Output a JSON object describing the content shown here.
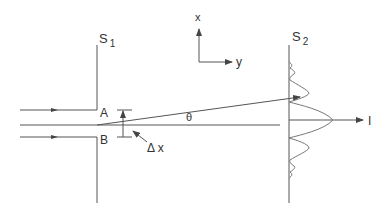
{
  "diagram": {
    "labels": {
      "screen1": "S",
      "screen1_sub": "1",
      "screen2": "S",
      "screen2_sub": "2",
      "edge_top": "A",
      "edge_bottom": "B",
      "slit_width": "Δ x",
      "angle": "θ",
      "axis_x": "x",
      "axis_y": "y",
      "intensity": "I"
    },
    "colors": {
      "line": "#555555",
      "curve": "#777777",
      "text": "#333333",
      "background": "#ffffff"
    }
  }
}
